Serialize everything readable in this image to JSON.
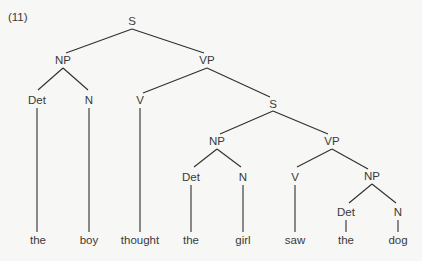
{
  "example_number": "(11)",
  "tree": {
    "nodes": {
      "s1": {
        "label": "S",
        "x": 132,
        "y": 25
      },
      "np1": {
        "label": "NP",
        "x": 63,
        "y": 64
      },
      "vp1": {
        "label": "VP",
        "x": 207,
        "y": 64
      },
      "det1": {
        "label": "Det",
        "x": 37,
        "y": 103
      },
      "n1": {
        "label": "N",
        "x": 89,
        "y": 103
      },
      "v1": {
        "label": "V",
        "x": 140,
        "y": 103
      },
      "s2": {
        "label": "S",
        "x": 273,
        "y": 107
      },
      "np2": {
        "label": "NP",
        "x": 217,
        "y": 145
      },
      "vp2": {
        "label": "VP",
        "x": 332,
        "y": 145
      },
      "det2": {
        "label": "Det",
        "x": 191,
        "y": 180
      },
      "n2": {
        "label": "N",
        "x": 243,
        "y": 180
      },
      "v2": {
        "label": "V",
        "x": 295,
        "y": 180
      },
      "np3": {
        "label": "NP",
        "x": 372,
        "y": 180
      },
      "det3": {
        "label": "Det",
        "x": 346,
        "y": 215
      },
      "n3": {
        "label": "N",
        "x": 398,
        "y": 215
      }
    },
    "words": [
      {
        "text": "the",
        "x": 38
      },
      {
        "text": "boy",
        "x": 89
      },
      {
        "text": "thought",
        "x": 140
      },
      {
        "text": "the",
        "x": 191
      },
      {
        "text": "girl",
        "x": 243
      },
      {
        "text": "saw",
        "x": 295
      },
      {
        "text": "the",
        "x": 346
      },
      {
        "text": "dog",
        "x": 398
      }
    ],
    "word_y": 244
  },
  "colors": {
    "line": "#2f2f2f",
    "text": "#3a3a3a",
    "background": "#f7f7f5"
  }
}
